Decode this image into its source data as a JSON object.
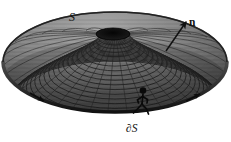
{
  "figure": {
    "caption_absent": true,
    "background_color": "#ffffff",
    "ink_color": "#111111",
    "surface_name": "wireframe-dome-surface",
    "labels": {
      "surface": "S",
      "normal": "n",
      "boundary": "∂S"
    },
    "elements": {
      "surface_description": "shaded wireframe elliptical dome (paraboloid cap) drawn in perspective with radial and concentric mesh lines and a dark opening at the apex",
      "boundary_description": "thick dark closed curve tracing the rim of the surface, oriented counter-clockwise as seen from the normal side",
      "normal_arrow_description": "straight arrow emerging from the upper-right of the surface pointing up and to the right",
      "walker_description": "stick figure walking along the boundary curve with the surface on its left"
    },
    "geometry": {
      "surface_center": [
        115,
        62
      ],
      "surface_radius_x": 112,
      "surface_radius_y": 50,
      "apex_hole_center": [
        113,
        34
      ],
      "apex_hole_radius_x": 17,
      "apex_hole_radius_y": 6,
      "normal_arrow_start": [
        166,
        50
      ],
      "normal_arrow_end": [
        186,
        22
      ],
      "walker_position": [
        143,
        104
      ],
      "radial_line_count": 48,
      "ring_count": 26
    },
    "colors": {
      "mesh_light": "#bdbdbd",
      "mesh_mid": "#6f6f6f",
      "mesh_dark": "#2a2a2a",
      "boundary": "#0d0d0d",
      "fill_top": "#9a9a9a",
      "fill_bottom": "#3a3a3a"
    }
  }
}
